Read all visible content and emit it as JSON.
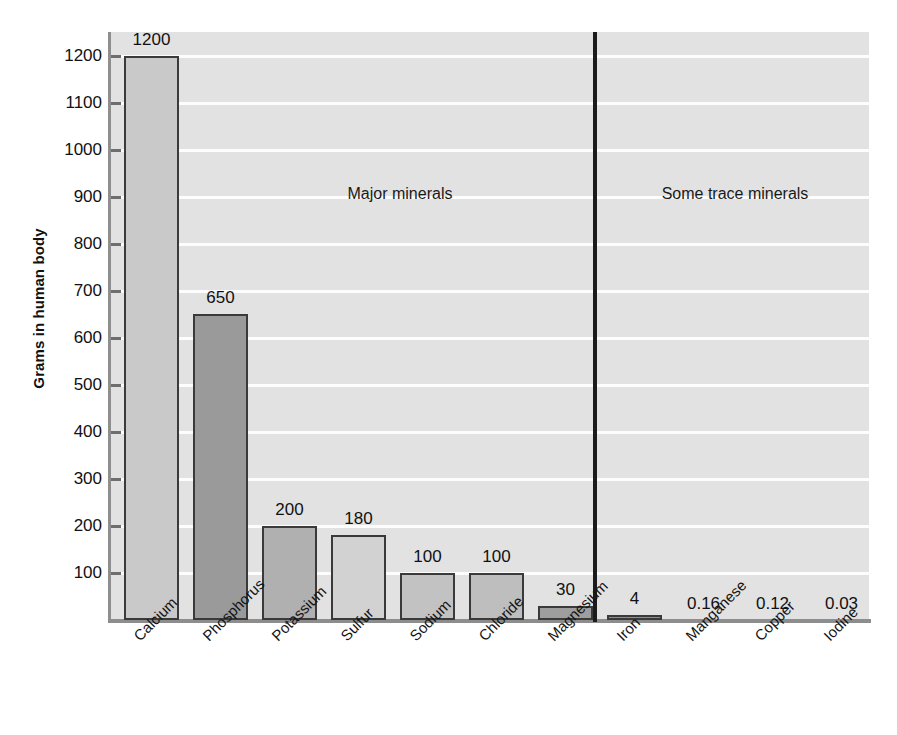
{
  "chart_data": {
    "type": "bar",
    "title": "",
    "xlabel": "",
    "ylabel": "Grams in human body",
    "ylim": [
      0,
      1250
    ],
    "grid": true,
    "legend": "none",
    "yticks": [
      100,
      200,
      300,
      400,
      500,
      600,
      700,
      800,
      900,
      1000,
      1100,
      1200
    ],
    "ytick_labels": [
      "100",
      "200",
      "300",
      "400",
      "500",
      "600",
      "700",
      "800",
      "900",
      "1000",
      "1100",
      "1200"
    ],
    "categories": [
      "Calcium",
      "Phosphorus",
      "Potassium",
      "Sulfur",
      "Sodium",
      "Chloride",
      "Magnesium",
      "Iron",
      "Manganese",
      "Copper",
      "Iodine"
    ],
    "values": [
      1200,
      650,
      200,
      180,
      100,
      100,
      30,
      4,
      0.16,
      0.12,
      0.03
    ],
    "value_labels": [
      "1200",
      "650",
      "200",
      "180",
      "100",
      "100",
      "30",
      "4",
      "0.16",
      "0.12",
      "0.03"
    ],
    "bar_colors": [
      "#c9c9c9",
      "#9a9a9a",
      "#b0b0b0",
      "#d2d2d2",
      "#c2c2c2",
      "#bebebe",
      "#9e9e9e",
      "#8f8f8f",
      "#8f8f8f",
      "#8f8f8f",
      "#8f8f8f"
    ],
    "annotations": [
      {
        "text": "Major minerals",
        "x": 400,
        "y": 185
      },
      {
        "text": "Some trace minerals",
        "x": 735,
        "y": 185
      }
    ],
    "group_divider": {
      "after_category": "Magnesium"
    },
    "plot_background": "#e2e2e2",
    "gridline_color": "#fdfdfd",
    "bar_edge_color": "#3a3a3a"
  }
}
